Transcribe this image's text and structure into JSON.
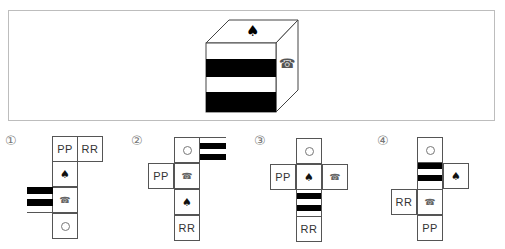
{
  "question": {
    "cube": {
      "top_face": "spade",
      "front_face": "horizontal-stripes",
      "right_face": "telephone",
      "colors": {
        "stripe": "#000000",
        "line": "#555555"
      }
    }
  },
  "options": [
    {
      "number": "①",
      "faces": [
        {
          "symbol": "PP"
        },
        {
          "symbol": "RR"
        },
        {
          "symbol": "spade",
          "glyph": "♠"
        },
        {
          "symbol": "telephone",
          "glyph": "☎"
        },
        {
          "symbol": "stripes"
        },
        {
          "symbol": "circle"
        }
      ]
    },
    {
      "number": "②",
      "faces": [
        {
          "symbol": "circle"
        },
        {
          "symbol": "stripes"
        },
        {
          "symbol": "PP"
        },
        {
          "symbol": "telephone",
          "glyph": "☎"
        },
        {
          "symbol": "spade",
          "glyph": "♠"
        },
        {
          "symbol": "RR"
        }
      ]
    },
    {
      "number": "③",
      "faces": [
        {
          "symbol": "circle"
        },
        {
          "symbol": "PP"
        },
        {
          "symbol": "spade",
          "glyph": "♠"
        },
        {
          "symbol": "telephone",
          "glyph": "☎"
        },
        {
          "symbol": "stripes"
        },
        {
          "symbol": "RR"
        }
      ]
    },
    {
      "number": "④",
      "faces": [
        {
          "symbol": "circle"
        },
        {
          "symbol": "stripes"
        },
        {
          "symbol": "spade",
          "glyph": "♠"
        },
        {
          "symbol": "RR"
        },
        {
          "symbol": "telephone",
          "glyph": "☎"
        },
        {
          "symbol": "PP"
        }
      ]
    }
  ]
}
